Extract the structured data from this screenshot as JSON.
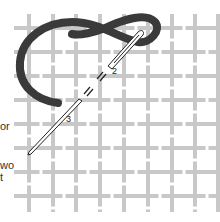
{
  "diagram": {
    "side_text_fragments": [
      {
        "text": "or",
        "top": 121
      },
      {
        "text": "wo",
        "top": 160
      },
      {
        "text": "t",
        "top": 172
      }
    ],
    "step_labels": [
      {
        "text": "2",
        "x": 112,
        "y": 74
      },
      {
        "text": "3",
        "x": 66,
        "y": 122
      }
    ],
    "colors": {
      "grid": "#c8c8c8",
      "thread": "#3a3a3a",
      "needle_outline": "#222222",
      "background": "#ffffff",
      "text": "#333333"
    }
  }
}
